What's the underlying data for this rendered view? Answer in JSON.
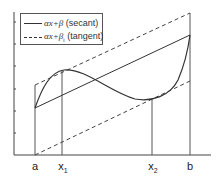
{
  "legend": {
    "items": [
      {
        "style": "solid",
        "label": "αx+β (secant)",
        "math": "αx+β",
        "desc": "(secant)"
      },
      {
        "style": "dashed",
        "label": "αx+βi (tangent)",
        "math": "αx+β",
        "sub": "i",
        "desc": "(tangent)"
      }
    ]
  },
  "axis": {
    "ticks": [
      {
        "label": "a",
        "x": 35
      },
      {
        "label": "x",
        "sub": "1",
        "x": 62
      },
      {
        "label": "x",
        "sub": "2",
        "x": 152
      },
      {
        "label": "b",
        "x": 190
      }
    ]
  },
  "colors": {
    "line": "#333333",
    "guide": "#555555",
    "axis": "#444444"
  }
}
